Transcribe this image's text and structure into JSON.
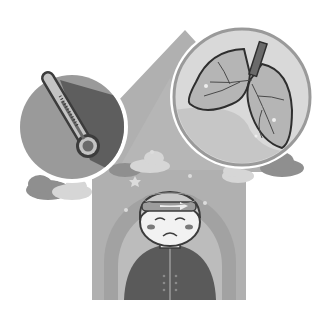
{
  "illustration": {
    "subject": "Sick child with fever and lung illness",
    "top_text_cutoff": "",
    "elements": {
      "thermometer": {
        "icon": "thermometer-icon",
        "bubble_fill": "#9a9a9a",
        "shadow_fill": "#5e5e5e"
      },
      "lungs": {
        "icon": "lungs-icon",
        "bubble_fill": "#d9d9d9",
        "lung_fill": "#b5b5b5"
      },
      "house": {
        "fill": "#b0b0b0",
        "arch_outer": "#a2a2a2",
        "arch_inner": "#bcbcbc"
      },
      "child": {
        "expression": "sad",
        "shirt_fill": "#5a5a5a",
        "hair_fill": "#c8c8c8",
        "face_fill": "#f2f2f2",
        "headband_fill": "#9c9c9c"
      },
      "clouds": {
        "dark": "#8f8f8f",
        "light": "#d6d6d6"
      }
    }
  }
}
